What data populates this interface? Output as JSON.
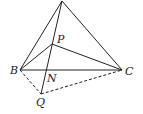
{
  "diagram": {
    "type": "geometry",
    "points": {
      "A": {
        "x": 62,
        "y": 1,
        "label": ""
      },
      "B": {
        "x": 20,
        "y": 70,
        "label": "B"
      },
      "C": {
        "x": 122,
        "y": 70,
        "label": "C"
      },
      "P": {
        "x": 52,
        "y": 44,
        "label": "P"
      },
      "N": {
        "x": 46,
        "y": 70,
        "label": "N"
      },
      "Q": {
        "x": 41,
        "y": 94,
        "label": "Q"
      }
    },
    "solid_segments": [
      [
        "A",
        "B"
      ],
      [
        "A",
        "C"
      ],
      [
        "A",
        "Q"
      ],
      [
        "P",
        "B"
      ],
      [
        "P",
        "C"
      ],
      [
        "B",
        "C"
      ]
    ],
    "dashed_segments": [
      [
        "B",
        "Q"
      ],
      [
        "Q",
        "C"
      ]
    ],
    "stroke_color": "#222222"
  }
}
